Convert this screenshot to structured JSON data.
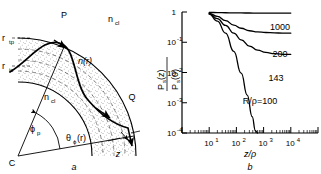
{
  "figure": {
    "panels": [
      {
        "id": "a",
        "letter": "a",
        "type": "ray-diagram",
        "description": "Meridional ray path in a bent graded-index optical fibre",
        "labels": {
          "point_p": "P",
          "point_q": "Q",
          "point_c": "C",
          "axis_z": "z",
          "r_tp_base": "r",
          "r_tp_sub": "tp",
          "r_ic_base": "r",
          "r_ic_sub": "ic",
          "n_cl_outer_base": "n",
          "n_cl_outer_sub": "cl",
          "n_cl_inner_base": "n",
          "n_cl_inner_sub": "cl",
          "index_profile": "n(r)",
          "phi_p_base": "ϕ",
          "phi_p_sub": "p",
          "theta_base": "θ",
          "theta_sub": "ϕ",
          "theta_arg": "(r)"
        }
      },
      {
        "id": "b",
        "letter": "b",
        "type": "log-log-plot"
      }
    ]
  },
  "chart_data": {
    "type": "line",
    "title": "",
    "xlabel": "z/ρ",
    "ylabel": "Pₛ(z) / Pₛ(0)",
    "ylabel_num": "P",
    "ylabel_num_sub": "s",
    "ylabel_num_arg": "(z)",
    "ylabel_den": "P",
    "ylabel_den_sub": "s",
    "ylabel_den_arg": "(0)",
    "xscale": "log",
    "yscale": "log",
    "xlim": [
      1,
      100000
    ],
    "ylim": [
      0.0001,
      1
    ],
    "grid": false,
    "legend_position": "inline-right",
    "xticks": [
      {
        "value": 10,
        "base": "10",
        "exp": "1"
      },
      {
        "value": 100,
        "base": "10",
        "exp": "2"
      },
      {
        "value": 1000,
        "base": "10",
        "exp": "3"
      },
      {
        "value": 10000,
        "base": "10",
        "exp": "4"
      }
    ],
    "yticks": [
      {
        "value": 1,
        "base": "1",
        "exp": ""
      },
      {
        "value": 0.1,
        "base": "10",
        "exp": "-1"
      },
      {
        "value": 0.01,
        "base": "10",
        "exp": "-2"
      },
      {
        "value": 0.001,
        "base": "10",
        "exp": "-3"
      },
      {
        "value": 0.0001,
        "base": "10",
        "exp": "-4"
      }
    ],
    "series": [
      {
        "name": "1000",
        "label": "1000",
        "x": [
          10,
          20,
          40,
          80,
          150,
          300,
          600,
          1200,
          2500,
          5000,
          10000
        ],
        "y": [
          0.97,
          0.955,
          0.945,
          0.935,
          0.93,
          0.925,
          0.922,
          0.92,
          0.92,
          0.92,
          0.92
        ]
      },
      {
        "name": "200",
        "label": "200",
        "x": [
          10,
          20,
          40,
          80,
          150,
          300,
          600,
          1200,
          2500,
          5000,
          10000
        ],
        "y": [
          0.9,
          0.72,
          0.52,
          0.37,
          0.29,
          0.24,
          0.22,
          0.21,
          0.205,
          0.2,
          0.2
        ]
      },
      {
        "name": "143",
        "label": "143",
        "x": [
          10,
          20,
          40,
          80,
          150,
          300,
          600,
          1200,
          2500,
          5000,
          10000
        ],
        "y": [
          0.88,
          0.6,
          0.36,
          0.2,
          0.12,
          0.075,
          0.055,
          0.046,
          0.042,
          0.04,
          0.04
        ]
      },
      {
        "name": "R/rho=100",
        "label": "R/ρ=100",
        "label_parts": {
          "r": "R",
          "slash": "/",
          "rho": "ρ",
          "eq": "=100"
        },
        "x": [
          10,
          20,
          40,
          80,
          150,
          250,
          380,
          500,
          600
        ],
        "y": [
          0.85,
          0.5,
          0.2,
          0.05,
          0.0095,
          0.0018,
          0.00035,
          0.00012,
          0.0001
        ]
      }
    ]
  }
}
